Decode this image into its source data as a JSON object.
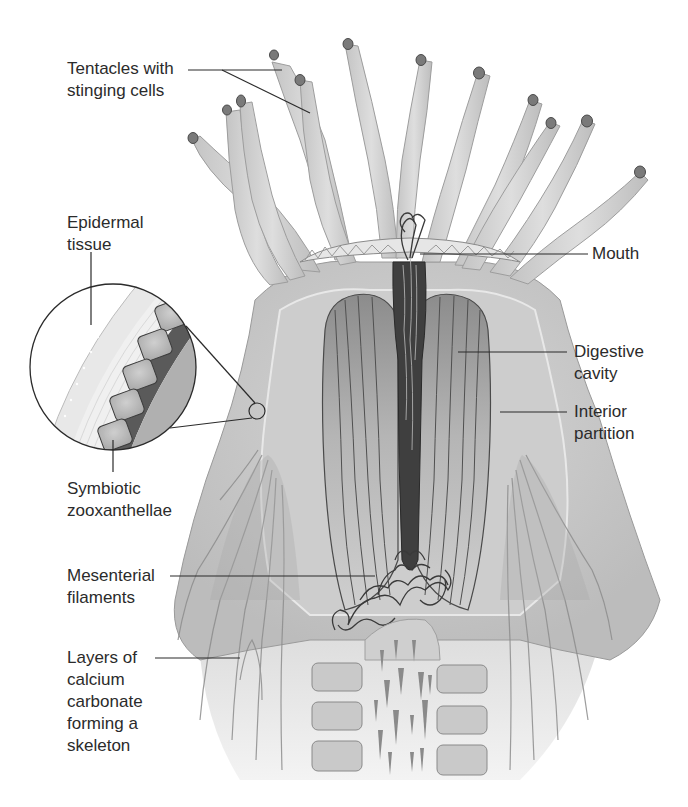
{
  "figure": {
    "colors": {
      "tissue_light": "#d9d9d9",
      "tissue_mid": "#bdbdbd",
      "tissue_dark": "#8a8a8a",
      "cavity_dark": "#4a4a4a",
      "outline": "#5a5a5a",
      "leader_line": "#2b2b2b",
      "text": "#2b2b2b"
    }
  },
  "labels": {
    "tentacles": "Tentacles with\nstinging cells",
    "epidermal": "Epidermal\ntissue",
    "symbiotic": "Symbiotic\nzooxanthellae",
    "mesenterial": "Mesenterial\nfilaments",
    "layers": "Layers of\ncalcium\ncarbonate\nforming a\nskeleton",
    "mouth": "Mouth",
    "digestive": "Digestive\ncavity",
    "interior": "Interior\npartition"
  }
}
